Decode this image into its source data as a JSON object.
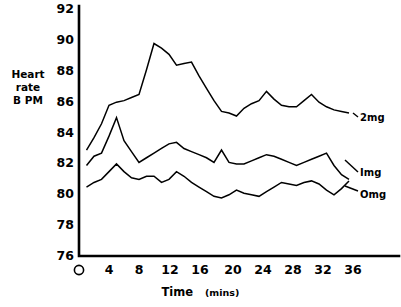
{
  "figure": {
    "background_color": "#ffffff",
    "ink_color": "#000000"
  },
  "yaxis": {
    "label_line1": "Heart",
    "label_line2": "rate",
    "label_line3": "B PM",
    "ticks": [
      "92",
      "90",
      "88",
      "86",
      "84",
      "82",
      "80",
      "78",
      "76"
    ]
  },
  "xaxis": {
    "title_main": "Time",
    "title_unit": "(mins)",
    "origin_label": "O",
    "ticks": [
      "4",
      "8",
      "12",
      "16",
      "20",
      "24",
      "28",
      "32",
      "36"
    ]
  },
  "series_labels": {
    "two_mg": "2mg",
    "one_mg": "Img",
    "zero_mg": "Omg"
  },
  "chart_data": {
    "type": "line",
    "title": "",
    "xlabel": "Time (mins)",
    "ylabel": "Heart rate BPM",
    "xlim": [
      0,
      38
    ],
    "ylim": [
      76,
      92
    ],
    "yticks": [
      76,
      78,
      80,
      82,
      84,
      86,
      88,
      90,
      92
    ],
    "xticks": [
      0,
      4,
      8,
      12,
      16,
      20,
      24,
      28,
      32,
      36
    ],
    "grid": false,
    "legend": "inline-right-of-curve",
    "x": [
      1,
      2,
      3,
      4,
      5,
      6,
      7,
      8,
      9,
      10,
      11,
      12,
      13,
      14,
      15,
      16,
      17,
      18,
      19,
      20,
      21,
      22,
      23,
      24,
      25,
      26,
      27,
      28,
      29,
      30,
      31,
      32,
      33,
      34,
      35,
      36
    ],
    "series": [
      {
        "name": "2mg",
        "label": "2mg",
        "values": [
          82.8,
          83.6,
          84.5,
          85.7,
          85.9,
          86.0,
          86.2,
          86.4,
          88.0,
          89.7,
          89.4,
          89.0,
          88.3,
          88.4,
          88.5,
          87.6,
          86.8,
          86.0,
          85.3,
          85.2,
          85.0,
          85.5,
          85.8,
          86.0,
          86.6,
          86.1,
          85.7,
          85.6,
          85.6,
          86.0,
          86.4,
          85.9,
          85.6,
          85.4,
          85.3,
          85.2
        ]
      },
      {
        "name": "1mg",
        "label": "Img",
        "values": [
          81.8,
          82.4,
          82.6,
          83.7,
          84.9,
          83.4,
          82.7,
          82.0,
          82.3,
          82.6,
          82.9,
          83.2,
          83.3,
          82.9,
          82.7,
          82.5,
          82.3,
          82.0,
          82.8,
          82.0,
          81.9,
          81.9,
          82.1,
          82.3,
          82.5,
          82.4,
          82.2,
          82.0,
          81.8,
          82.0,
          82.2,
          82.4,
          82.6,
          81.8,
          81.2,
          80.9
        ]
      },
      {
        "name": "0mg",
        "label": "Omg",
        "values": [
          80.4,
          80.7,
          80.9,
          81.4,
          81.9,
          81.4,
          81.0,
          80.9,
          81.1,
          81.1,
          80.7,
          80.9,
          81.4,
          81.1,
          80.7,
          80.4,
          80.1,
          79.8,
          79.7,
          79.9,
          80.2,
          80.0,
          79.9,
          79.8,
          80.1,
          80.4,
          80.7,
          80.6,
          80.5,
          80.7,
          80.8,
          80.6,
          80.2,
          79.9,
          80.3,
          80.8
        ]
      }
    ]
  }
}
